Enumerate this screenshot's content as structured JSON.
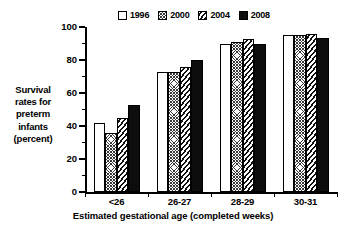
{
  "chart_data": {
    "type": "bar",
    "title": "",
    "xlabel": "Estimated gestational age (completed weeks)",
    "ylabel": "Survival rates for preterm infants (percent)",
    "ylabel_lines": [
      "Survival",
      "rates for",
      "preterm",
      "infants",
      "(percent)"
    ],
    "categories": [
      "<26",
      "26-27",
      "28-29",
      "30-31"
    ],
    "series": [
      {
        "name": "1996",
        "pattern": "open-white",
        "values": [
          42,
          73,
          90,
          95
        ]
      },
      {
        "name": "2000",
        "pattern": "cross-hatch",
        "values": [
          36,
          73,
          91,
          95
        ]
      },
      {
        "name": "2004",
        "pattern": "diagonal-hatch",
        "values": [
          45,
          76,
          92.5,
          95.5
        ]
      },
      {
        "name": "2008",
        "pattern": "solid-black",
        "values": [
          53,
          80,
          90,
          93.5
        ]
      }
    ],
    "ylim": [
      0,
      100
    ],
    "yticks": [
      0,
      20,
      40,
      60,
      80,
      100
    ],
    "ytick_labels": [
      "0",
      "20",
      "40",
      "60",
      "80",
      "100"
    ],
    "yminor_step": 10,
    "grid": false,
    "legend_position": "top-center",
    "colors": {
      "axis": "#000000",
      "bar_outline": "#000000",
      "series_1996": "#ffffff",
      "series_2008": "#0d0d0d",
      "background": "#ffffff"
    }
  },
  "legend": {
    "items": [
      {
        "label": "1996"
      },
      {
        "label": "2000"
      },
      {
        "label": "2004"
      },
      {
        "label": "2008"
      }
    ]
  }
}
